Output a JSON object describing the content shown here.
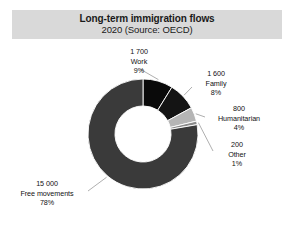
{
  "header": {
    "title": "Long-term immigration flows",
    "subtitle": "2020 (Source: OECD)"
  },
  "chart_data": {
    "type": "pie",
    "variant": "donut",
    "title": "Long-term immigration flows",
    "subtitle": "2020 (Source: OECD)",
    "source": "OECD",
    "year": "2020",
    "unit": "persons",
    "total": 19300,
    "legend_position": "none",
    "labels_position": "outside-with-leader-lines",
    "start_angle_deg": 0,
    "direction": "clockwise",
    "inner_radius_ratio": 0.51,
    "categories": [
      "Work",
      "Family",
      "Humanitarian",
      "Other",
      "Free movements"
    ],
    "values": [
      1700,
      1600,
      800,
      200,
      15000
    ],
    "percents": [
      9,
      8,
      4,
      1,
      78
    ],
    "value_labels": [
      "1 700",
      "1 600",
      "800",
      "200",
      "15 000"
    ],
    "percent_labels": [
      "9%",
      "8%",
      "4%",
      "1%",
      "78%"
    ],
    "colors": [
      "#0a0a0a",
      "#141414",
      "#b5b5b5",
      "#8a8a8a",
      "#3a3a3a"
    ],
    "slices": [
      {
        "name": "Work",
        "value": 1700,
        "value_label": "1 700",
        "percent": 9,
        "percent_label": "9%",
        "color": "#0a0a0a"
      },
      {
        "name": "Family",
        "value": 1600,
        "value_label": "1 600",
        "percent": 8,
        "percent_label": "8%",
        "color": "#141414"
      },
      {
        "name": "Humanitarian",
        "value": 800,
        "value_label": "800",
        "percent": 4,
        "percent_label": "4%",
        "color": "#b5b5b5"
      },
      {
        "name": "Other",
        "value": 200,
        "value_label": "200",
        "percent": 1,
        "percent_label": "1%",
        "color": "#8a8a8a"
      },
      {
        "name": "Free movements",
        "value": 15000,
        "value_label": "15 000",
        "percent": 78,
        "percent_label": "78%",
        "color": "#3a3a3a"
      }
    ]
  },
  "style": {
    "title_band_color": "#d9d9d9",
    "background": "#ffffff",
    "text_color": "#111111",
    "leader_line_color": "#9a9a9a",
    "slice_edge_color": "#ffffff"
  }
}
